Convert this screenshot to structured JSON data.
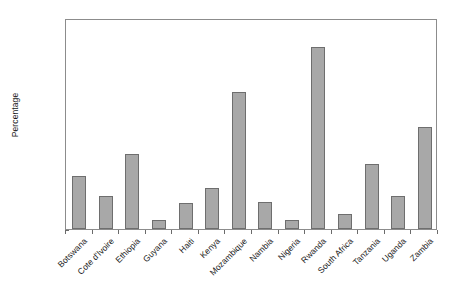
{
  "chart_data": {
    "type": "bar",
    "title": "",
    "xlabel": "",
    "ylabel": "Percentage",
    "ylim": [
      0.0,
      0.6
    ],
    "yticks": [
      "0.00",
      "0.10",
      "0.20",
      "0.30",
      "0.40",
      "0.50",
      "0.60"
    ],
    "ytick_values": [
      0.0,
      0.1,
      0.2,
      0.3,
      0.4,
      0.5,
      0.6
    ],
    "grid": false,
    "legend": null,
    "bar_color": "#a8a8a8",
    "bar_edge_color": "#6e6e6e",
    "axis_color": "#8c8c8c",
    "categories": [
      "Botswana",
      "Cote d'Ivoire",
      "Ethiopia",
      "Guyana",
      "Haiti",
      "Kenya",
      "Mozambique",
      "Nambia",
      "Nigeria",
      "Rwanda",
      "South Africa",
      "Tanzania",
      "Uganda",
      "Zambia"
    ],
    "values": [
      0.15,
      0.095,
      0.213,
      0.027,
      0.075,
      0.118,
      0.39,
      0.077,
      0.026,
      0.518,
      0.042,
      0.185,
      0.095,
      0.29
    ]
  }
}
